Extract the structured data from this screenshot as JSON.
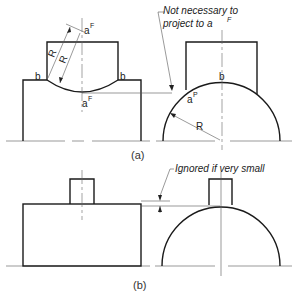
{
  "figure": {
    "part_a": {
      "caption": "(a)",
      "note": {
        "line1": "Not necessary to",
        "line2": "project to a",
        "line2_sup": "F"
      },
      "labels": {
        "b": "b",
        "a": "a",
        "sup_F": "F",
        "sup_P": "P",
        "R": "R"
      }
    },
    "part_b": {
      "caption": "(b)",
      "note": "Ignored if very small"
    }
  }
}
